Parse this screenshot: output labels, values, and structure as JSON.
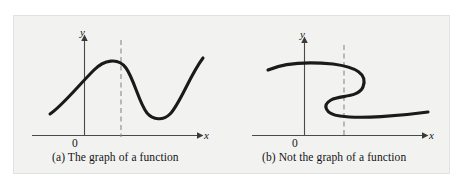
{
  "figure": {
    "background_color": "#f2f2f1",
    "border_color": "#e2e2e0",
    "page_background": "#ffffff",
    "curve_color": "#1a1a1a",
    "axis_color": "#4a4a4a",
    "dash_color": "#8a8a8a"
  },
  "panels": [
    {
      "id": "panel-a",
      "caption": "(a) The graph of a function",
      "origin_label": "0",
      "x_axis_label": "x",
      "y_axis_label": "y",
      "dashed_line_x": 121,
      "passes_vertical_line_test": true,
      "curve_description": "smooth wave rising from lower left to a peak, dipping to a trough, then rising again",
      "curve_path": "M 50 114 C 62 106, 78 86, 94 70 C 104 60, 118 57, 126 68 C 134 79, 139 103, 147 113 C 153 120, 163 121, 170 114 C 180 104, 190 75, 203 58"
    },
    {
      "id": "panel-b",
      "caption": "(b) Not the graph of a function",
      "origin_label": "0",
      "x_axis_label": "x",
      "y_axis_label": "y",
      "dashed_line_x": 344,
      "passes_vertical_line_test": false,
      "curve_description": "backward S shaped curve that a vertical line crosses three times",
      "curve_path": "M 268 70 C 286 62, 312 62, 333 64 C 356 67, 368 74, 363 87 C 358 98, 340 95, 331 100 C 322 105, 325 114, 340 116 C 360 119, 400 116, 428 112"
    }
  ],
  "chart_data": {
    "type": "line",
    "title": "",
    "xlabel": "x",
    "ylabel": "y",
    "grid": false,
    "legend": "none",
    "panels": [
      {
        "label": "(a) The graph of a function",
        "series_name": "function curve",
        "vertical_line_test_intersections": 1,
        "dashed_test_line_x": 0.38,
        "points": [
          {
            "x": 0.0,
            "y": 0.22
          },
          {
            "x": 0.12,
            "y": 0.4
          },
          {
            "x": 0.29,
            "y": 0.66
          },
          {
            "x": 0.4,
            "y": 0.71
          },
          {
            "x": 0.5,
            "y": 0.58
          },
          {
            "x": 0.63,
            "y": 0.3
          },
          {
            "x": 0.72,
            "y": 0.2
          },
          {
            "x": 0.8,
            "y": 0.25
          },
          {
            "x": 0.9,
            "y": 0.48
          },
          {
            "x": 1.0,
            "y": 0.75
          }
        ]
      },
      {
        "label": "(b) Not the graph of a function",
        "series_name": "relation curve",
        "vertical_line_test_intersections": 3,
        "dashed_test_line_x": 0.47,
        "points": [
          {
            "x": 0.0,
            "y": 0.62
          },
          {
            "x": 0.2,
            "y": 0.68
          },
          {
            "x": 0.4,
            "y": 0.69
          },
          {
            "x": 0.55,
            "y": 0.64
          },
          {
            "x": 0.59,
            "y": 0.55
          },
          {
            "x": 0.52,
            "y": 0.47
          },
          {
            "x": 0.43,
            "y": 0.43
          },
          {
            "x": 0.46,
            "y": 0.35
          },
          {
            "x": 0.6,
            "y": 0.33
          },
          {
            "x": 0.85,
            "y": 0.34
          },
          {
            "x": 1.0,
            "y": 0.36
          }
        ]
      }
    ]
  }
}
